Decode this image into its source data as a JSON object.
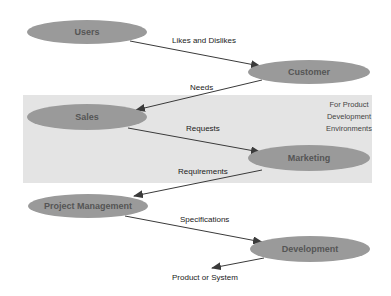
{
  "diagram": {
    "band": {
      "label_lines": [
        "For Product",
        "Development",
        "Environments"
      ],
      "color": "#e4e4e4"
    },
    "node_color": "#9a9a9a",
    "nodes": [
      {
        "id": "users",
        "label": "Users"
      },
      {
        "id": "customer",
        "label": "Customer"
      },
      {
        "id": "sales",
        "label": "Sales"
      },
      {
        "id": "marketing",
        "label": "Marketing"
      },
      {
        "id": "project_management",
        "label": "Project Management"
      },
      {
        "id": "development",
        "label": "Development"
      }
    ],
    "edges": [
      {
        "from": "users",
        "to": "customer",
        "label": "Likes and Dislikes"
      },
      {
        "from": "customer",
        "to": "sales",
        "label": "Needs"
      },
      {
        "from": "sales",
        "to": "marketing",
        "label": "Requests"
      },
      {
        "from": "marketing",
        "to": "project_management",
        "label": "Requirements"
      },
      {
        "from": "project_management",
        "to": "development",
        "label": "Specifications"
      },
      {
        "from": "development",
        "to": "output",
        "label": "Product or System"
      }
    ]
  }
}
